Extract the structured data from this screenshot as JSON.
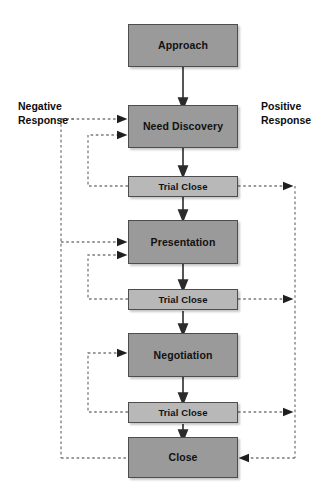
{
  "diagram": {
    "type": "flowchart",
    "colors": {
      "stage_fill": "#9a9a9a",
      "trial_fill": "#b8b8b8",
      "box_border": "#4d4d4d",
      "solid_arrow": "#2b2b2b",
      "dashed_arrow": "#6e6e6e",
      "text": "#111111",
      "background": "#ffffff"
    },
    "labels": {
      "negative": "Negative\nResponse",
      "positive": "Positive\nResponse"
    },
    "nodes": [
      {
        "id": "approach",
        "label": "Approach",
        "kind": "stage"
      },
      {
        "id": "need",
        "label": "Need Discovery",
        "kind": "stage"
      },
      {
        "id": "trial1",
        "label": "Trial Close",
        "kind": "trial"
      },
      {
        "id": "presentation",
        "label": "Presentation",
        "kind": "stage"
      },
      {
        "id": "trial2",
        "label": "Trial Close",
        "kind": "trial"
      },
      {
        "id": "negotiation",
        "label": "Negotiation",
        "kind": "stage"
      },
      {
        "id": "trial3",
        "label": "Trial Close",
        "kind": "trial"
      },
      {
        "id": "close",
        "label": "Close",
        "kind": "stage"
      }
    ],
    "edges": [
      {
        "from": "approach",
        "to": "need",
        "style": "solid",
        "direction": "down"
      },
      {
        "from": "need",
        "to": "trial1",
        "style": "solid",
        "direction": "down"
      },
      {
        "from": "trial1",
        "to": "presentation",
        "style": "solid",
        "direction": "down"
      },
      {
        "from": "presentation",
        "to": "trial2",
        "style": "solid",
        "direction": "down"
      },
      {
        "from": "trial2",
        "to": "negotiation",
        "style": "solid",
        "direction": "down"
      },
      {
        "from": "negotiation",
        "to": "trial3",
        "style": "solid",
        "direction": "down"
      },
      {
        "from": "trial3",
        "to": "close",
        "style": "solid",
        "direction": "down"
      },
      {
        "from": "trial1",
        "to": "need",
        "style": "dashed",
        "branch": "negative"
      },
      {
        "from": "trial2",
        "to": "presentation",
        "style": "dashed",
        "branch": "negative"
      },
      {
        "from": "trial3",
        "to": "negotiation",
        "style": "dashed",
        "branch": "negative"
      },
      {
        "from": "negative-bus",
        "to": "need",
        "style": "dashed",
        "branch": "negative"
      },
      {
        "from": "negative-bus",
        "to": "presentation",
        "style": "dashed",
        "branch": "negative"
      },
      {
        "from": "negative-bus",
        "to": "close",
        "style": "dashed",
        "branch": "negative"
      },
      {
        "from": "trial1",
        "to": "positive-bus",
        "style": "dashed",
        "branch": "positive"
      },
      {
        "from": "trial2",
        "to": "positive-bus",
        "style": "dashed",
        "branch": "positive"
      },
      {
        "from": "trial3",
        "to": "positive-bus",
        "style": "dashed",
        "branch": "positive"
      },
      {
        "from": "positive-bus",
        "to": "close",
        "style": "dashed",
        "branch": "positive"
      }
    ]
  }
}
